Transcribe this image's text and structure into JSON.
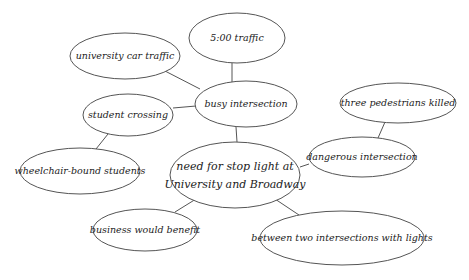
{
  "diagram": {
    "type": "cluster-map",
    "nodes": [
      {
        "id": "univ",
        "label": "university car traffic",
        "cx": 125,
        "cy": 56,
        "rx": 55,
        "ry": 23
      },
      {
        "id": "five",
        "label": "5:00 traffic",
        "cx": 237,
        "cy": 38,
        "rx": 48,
        "ry": 25
      },
      {
        "id": "busy",
        "label": "busy intersection",
        "cx": 246,
        "cy": 104,
        "rx": 51,
        "ry": 23
      },
      {
        "id": "three",
        "label": "three pedestrians killed",
        "cx": 398,
        "cy": 103,
        "rx": 58,
        "ry": 20
      },
      {
        "id": "student",
        "label": "student crossing",
        "cx": 128,
        "cy": 115,
        "rx": 45,
        "ry": 21
      },
      {
        "id": "danger",
        "label": "dangerous intersection",
        "cx": 362,
        "cy": 157,
        "rx": 53,
        "ry": 20
      },
      {
        "id": "center",
        "label": "need for stop light at",
        "label2": "University and Broadway",
        "cx": 235,
        "cy": 175,
        "rx": 65,
        "ry": 33
      },
      {
        "id": "wheel",
        "label": "wheelchair-bound students",
        "cx": 80,
        "cy": 171,
        "rx": 60,
        "ry": 23
      },
      {
        "id": "biz",
        "label": "business would benefit",
        "cx": 145,
        "cy": 230,
        "rx": 52,
        "ry": 21
      },
      {
        "id": "between",
        "label": "between two intersections with lights",
        "cx": 342,
        "cy": 238,
        "rx": 82,
        "ry": 27
      }
    ],
    "edges": [
      {
        "from": "univ",
        "to": "busy",
        "x1": 165,
        "y1": 71,
        "x2": 200,
        "y2": 89
      },
      {
        "from": "five",
        "to": "busy",
        "x1": 232,
        "y1": 63,
        "x2": 232,
        "y2": 82
      },
      {
        "from": "student",
        "to": "busy",
        "x1": 173,
        "y1": 108,
        "x2": 196,
        "y2": 106
      },
      {
        "from": "student",
        "to": "wheel",
        "x1": 108,
        "y1": 134,
        "x2": 96,
        "y2": 149
      },
      {
        "from": "busy",
        "to": "center",
        "x1": 236,
        "y1": 127,
        "x2": 237,
        "y2": 142
      },
      {
        "from": "three",
        "to": "danger",
        "x1": 385,
        "y1": 122,
        "x2": 378,
        "y2": 138
      },
      {
        "from": "danger",
        "to": "center",
        "x1": 309,
        "y1": 164,
        "x2": 300,
        "y2": 167
      },
      {
        "from": "center",
        "to": "biz",
        "x1": 196,
        "y1": 199,
        "x2": 175,
        "y2": 212
      },
      {
        "from": "center",
        "to": "between",
        "x1": 275,
        "y1": 199,
        "x2": 299,
        "y2": 215
      }
    ]
  }
}
